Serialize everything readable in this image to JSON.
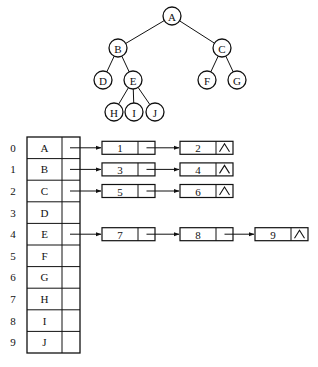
{
  "tree": {
    "nodes": [
      {
        "id": "A",
        "x": 172,
        "y": 16
      },
      {
        "id": "B",
        "x": 118,
        "y": 48
      },
      {
        "id": "C",
        "x": 222,
        "y": 48
      },
      {
        "id": "D",
        "x": 103,
        "y": 80
      },
      {
        "id": "E",
        "x": 133,
        "y": 80
      },
      {
        "id": "F",
        "x": 207,
        "y": 80
      },
      {
        "id": "G",
        "x": 237,
        "y": 80
      },
      {
        "id": "H",
        "x": 114,
        "y": 112
      },
      {
        "id": "I",
        "x": 134,
        "y": 112
      },
      {
        "id": "J",
        "x": 155,
        "y": 112
      }
    ],
    "edges": [
      [
        "A",
        "B"
      ],
      [
        "A",
        "C"
      ],
      [
        "B",
        "D"
      ],
      [
        "B",
        "E"
      ],
      [
        "C",
        "F"
      ],
      [
        "C",
        "G"
      ],
      [
        "E",
        "H"
      ],
      [
        "E",
        "I"
      ],
      [
        "E",
        "J"
      ]
    ]
  },
  "adjacency_table": {
    "rows": [
      {
        "index": "0",
        "vertex": "A",
        "children": [
          "1",
          "2"
        ]
      },
      {
        "index": "1",
        "vertex": "B",
        "children": [
          "3",
          "4"
        ]
      },
      {
        "index": "2",
        "vertex": "C",
        "children": [
          "5",
          "6"
        ]
      },
      {
        "index": "3",
        "vertex": "D",
        "children": []
      },
      {
        "index": "4",
        "vertex": "E",
        "children": [
          "7",
          "8",
          "9"
        ]
      },
      {
        "index": "5",
        "vertex": "F",
        "children": []
      },
      {
        "index": "6",
        "vertex": "G",
        "children": []
      },
      {
        "index": "7",
        "vertex": "H",
        "children": []
      },
      {
        "index": "8",
        "vertex": "I",
        "children": []
      },
      {
        "index": "9",
        "vertex": "J",
        "children": []
      }
    ],
    "null_symbol": "^"
  }
}
